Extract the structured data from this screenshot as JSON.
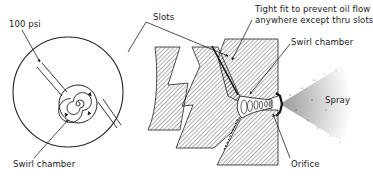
{
  "figure": {
    "colors": {
      "ink": "#222222",
      "background": "#ffffff",
      "hatch": "#333333"
    }
  },
  "end_view": {
    "labels": {
      "pressure": "100 psi",
      "swirl_chamber": "Swirl chamber"
    }
  },
  "section_view": {
    "labels": {
      "slots": "Slots",
      "tight_fit_line1": "Tight fit to prevent oil flow",
      "tight_fit_line2": "anywhere except thru slots",
      "swirl_chamber": "Swirl chamber",
      "orifice": "Orifice",
      "spray": "Spray"
    }
  }
}
